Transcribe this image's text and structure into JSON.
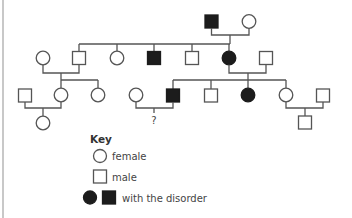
{
  "figure": {
    "type": "pedigree",
    "line_color": "#555555",
    "affected_fill": "#1c1c1c",
    "unaffected_fill": "#ffffff"
  },
  "generations": [
    {
      "name": "I",
      "individuals": [
        {
          "id": "I-1",
          "sex": "male",
          "affected": true
        },
        {
          "id": "I-2",
          "sex": "female",
          "affected": false
        }
      ]
    },
    {
      "name": "II",
      "individuals": [
        {
          "id": "II-1",
          "sex": "female",
          "affected": false,
          "note": "married-in spouse"
        },
        {
          "id": "II-2",
          "sex": "male",
          "affected": false
        },
        {
          "id": "II-3",
          "sex": "female",
          "affected": false
        },
        {
          "id": "II-4",
          "sex": "male",
          "affected": true
        },
        {
          "id": "II-5",
          "sex": "male",
          "affected": false
        },
        {
          "id": "II-6",
          "sex": "female",
          "affected": true
        },
        {
          "id": "II-7",
          "sex": "male",
          "affected": false,
          "note": "married-in spouse"
        }
      ]
    },
    {
      "name": "III",
      "individuals": [
        {
          "id": "III-1",
          "sex": "male",
          "affected": false,
          "note": "married-in spouse"
        },
        {
          "id": "III-2",
          "sex": "female",
          "affected": false
        },
        {
          "id": "III-3",
          "sex": "female",
          "affected": false
        },
        {
          "id": "III-4",
          "sex": "female",
          "affected": false,
          "note": "married-in spouse"
        },
        {
          "id": "III-5",
          "sex": "male",
          "affected": true
        },
        {
          "id": "III-6",
          "sex": "male",
          "affected": false
        },
        {
          "id": "III-7",
          "sex": "female",
          "affected": true
        },
        {
          "id": "III-8",
          "sex": "female",
          "affected": false
        },
        {
          "id": "III-9",
          "sex": "male",
          "affected": false,
          "note": "married-in spouse"
        }
      ]
    },
    {
      "name": "IV",
      "individuals": [
        {
          "id": "IV-1",
          "sex": "female",
          "affected": false
        },
        {
          "id": "IV-2",
          "sex": "unknown",
          "affected": null,
          "label": "?"
        },
        {
          "id": "IV-3",
          "sex": "male",
          "affected": false
        }
      ]
    }
  ],
  "unknown_child_label": "?",
  "key": {
    "title": "Key",
    "items": [
      {
        "symbol": "circle-outline",
        "label": "female"
      },
      {
        "symbol": "square-outline",
        "label": "male"
      },
      {
        "symbol": "filled-circle-and-square",
        "label": "with the disorder"
      }
    ]
  }
}
